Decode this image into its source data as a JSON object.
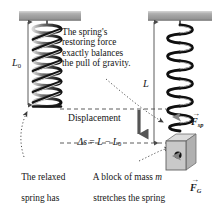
{
  "figure": {
    "colors": {
      "ceiling": "#a8a8a8",
      "ceiling_edge": "#8f8f8f",
      "spring_dark": "#111111",
      "spring_light": "#cfcfcf",
      "block_face": "#c9c9c9",
      "block_top": "#dcdcdc",
      "block_side": "#b0b0b0",
      "force_arrow": "#8c8c8c",
      "dash_line": "#4a4a4a",
      "text": "#151515"
    }
  },
  "annotations": {
    "restoring_force_note": "The spring's\nrestoring force\nexactly balances\nthe pull of gravity.",
    "relaxed_spring_note_line1": "The relaxed",
    "relaxed_spring_note_line2": "spring has",
    "relaxed_spring_note_line3_pre": "length ",
    "relaxed_spring_note_line3_sym": "L",
    "relaxed_spring_note_line3_sub": "0",
    "relaxed_spring_note_line3_post": ".",
    "block_note_line1_pre": "A block of mass ",
    "block_note_line1_sym": "m",
    "block_note_line2": "stretches the spring",
    "block_note_line3_pre": "to length ",
    "block_note_line3_sym": "L",
    "block_note_line3_post": "."
  },
  "measurements": {
    "relaxed_length_symbol": "L",
    "relaxed_length_subscript": "0",
    "stretched_length_symbol": "L",
    "displacement_caption": "Displacement",
    "displacement_eq_delta": "Δ",
    "displacement_eq_s": "s",
    "displacement_eq_equals": " = ",
    "displacement_eq_L": "L",
    "displacement_eq_minus": " − ",
    "displacement_eq_L0": "L",
    "displacement_eq_L0_sub": "0"
  },
  "forces": [
    {
      "name": "spring-force",
      "symbol": "F",
      "subscript": "sp",
      "vector_accent": "→",
      "direction": "up",
      "description": "Spring restoring force on block"
    },
    {
      "name": "gravity-force",
      "symbol": "F",
      "subscript": "G",
      "vector_accent": "→",
      "direction": "down",
      "description": "Gravitational force on block"
    }
  ],
  "objects": {
    "left_spring_label": "relaxed-spring",
    "right_spring_label": "stretched-spring",
    "block_label": "hanging-block",
    "ceiling_left_label": "ceiling-support-left",
    "ceiling_right_label": "ceiling-support-right",
    "center_of_mass_label": "center-of-mass-dot"
  }
}
